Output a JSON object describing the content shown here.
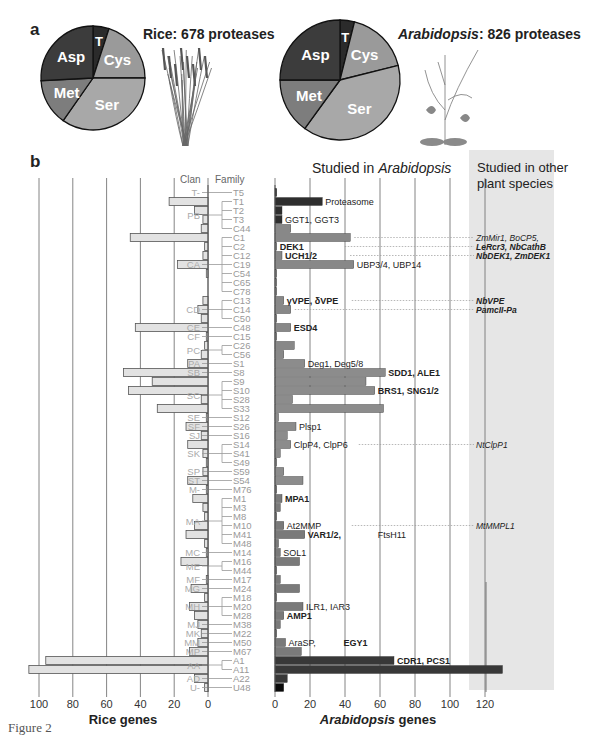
{
  "figure": {
    "caption": "Figure 2",
    "panel_a_label": "a",
    "panel_b_label": "b"
  },
  "chart_data": [
    {
      "type": "pie",
      "title": "Rice: 678 proteases",
      "species": "Rice",
      "total": 678,
      "categories": [
        "T",
        "Cys",
        "Ser",
        "Met",
        "Asp"
      ],
      "values_deg": [
        18,
        72,
        125,
        52,
        93
      ],
      "colors": [
        "#2b2b2b",
        "#9a9a9a",
        "#a8a8a8",
        "#7d7d7d",
        "#3c3c3c"
      ]
    },
    {
      "type": "pie",
      "title": "Arabidopsis: 826 proteases",
      "species": "Arabidopsis",
      "total": 826,
      "categories": [
        "T",
        "Cys",
        "Ser",
        "Met",
        "Asp"
      ],
      "values_deg": [
        14,
        62,
        140,
        54,
        90
      ],
      "colors": [
        "#2b2b2b",
        "#9a9a9a",
        "#a8a8a8",
        "#7d7d7d",
        "#3c3c3c"
      ]
    },
    {
      "type": "bar",
      "orientation": "horizontal-back-to-back",
      "left_axis": {
        "label": "Rice genes",
        "ticks": [
          100,
          80,
          60,
          40,
          20,
          0
        ],
        "range": [
          0,
          100
        ]
      },
      "right_axis": {
        "label": "Arabidopsis genes",
        "ticks": [
          0,
          20,
          40,
          60,
          80,
          100,
          120
        ],
        "range": [
          0,
          130
        ]
      },
      "column_headers": {
        "clan": "Clan",
        "family": "Family"
      },
      "right_header": "Studied in Arabidopsis",
      "other_species_header": "Studied in other plant species",
      "rows": [
        {
          "clan": "T-",
          "family": "T5",
          "rice": 0,
          "arab": 1,
          "group": "T"
        },
        {
          "clan": "PB",
          "family": "T1",
          "rice": 23,
          "arab": 27,
          "group": "T",
          "label": "Proteasome",
          "bold": false
        },
        {
          "clan": "",
          "family": "T2",
          "rice": 8,
          "arab": 4,
          "group": "T"
        },
        {
          "clan": "",
          "family": "T3",
          "rice": 3,
          "arab": 4,
          "group": "T",
          "label": "GGT1, GGT3",
          "bold": false
        },
        {
          "clan": "",
          "family": "C44",
          "rice": 4,
          "arab": 9,
          "group": "C"
        },
        {
          "clan": "CA",
          "family": "C1",
          "rice": 46,
          "arab": 43,
          "group": "C",
          "other": "ZmMir1, BoCP5,"
        },
        {
          "clan": "",
          "family": "C2",
          "rice": 2,
          "arab": 1,
          "group": "C",
          "label": "DEK1",
          "bold": true,
          "other": "LeRcr3, NbCathB"
        },
        {
          "clan": "",
          "family": "C12",
          "rice": 3,
          "arab": 4,
          "group": "C",
          "label": "UCH1/2",
          "bold": true,
          "other": "NbDEK1, ZmDEK1"
        },
        {
          "clan": "",
          "family": "C19",
          "rice": 18,
          "arab": 45,
          "group": "C",
          "label": "UBP3/4, UBP14",
          "bold": false
        },
        {
          "clan": "",
          "family": "C54",
          "rice": 1,
          "arab": 1,
          "group": "C"
        },
        {
          "clan": "",
          "family": "C65",
          "rice": 0,
          "arab": 1,
          "group": "C"
        },
        {
          "clan": "",
          "family": "C78",
          "rice": 0,
          "arab": 1,
          "group": "C"
        },
        {
          "clan": "CD",
          "family": "C13",
          "rice": 3,
          "arab": 5,
          "group": "C",
          "label": "γVPE,   δVPE",
          "bold": true,
          "other": "NbVPE"
        },
        {
          "clan": "",
          "family": "C14",
          "rice": 6,
          "arab": 9,
          "group": "C",
          "other": "PamcII-Pa"
        },
        {
          "clan": "",
          "family": "C50",
          "rice": 4,
          "arab": 1,
          "group": "C"
        },
        {
          "clan": "CE",
          "family": "C48",
          "rice": 43,
          "arab": 9,
          "group": "C",
          "label": "ESD4",
          "bold": true
        },
        {
          "clan": "CF",
          "family": "C15",
          "rice": 1,
          "arab": 1,
          "group": "C"
        },
        {
          "clan": "PC",
          "family": "C26",
          "rice": 2,
          "arab": 11,
          "group": "C"
        },
        {
          "clan": "",
          "family": "C56",
          "rice": 4,
          "arab": 5,
          "group": "C"
        },
        {
          "clan": "PA",
          "family": "S1",
          "rice": 12,
          "arab": 17,
          "group": "S",
          "label": "Deg1,    Deg5/8",
          "bold": false
        },
        {
          "clan": "SB",
          "family": "S8",
          "rice": 50,
          "arab": 63,
          "group": "S",
          "label": "SDD1, ALE1",
          "bold": true
        },
        {
          "clan": "SC",
          "family": "S9",
          "rice": 33,
          "arab": 52,
          "group": "S"
        },
        {
          "clan": "",
          "family": "S10",
          "rice": 47,
          "arab": 57,
          "group": "S",
          "label": "BRS1, SNG1/2",
          "bold": true
        },
        {
          "clan": "",
          "family": "S28",
          "rice": 4,
          "arab": 10,
          "group": "S"
        },
        {
          "clan": "",
          "family": "S33",
          "rice": 30,
          "arab": 62,
          "group": "S"
        },
        {
          "clan": "SE",
          "family": "S12",
          "rice": 1,
          "arab": 2,
          "group": "S"
        },
        {
          "clan": "SF",
          "family": "S26",
          "rice": 13,
          "arab": 12,
          "group": "S",
          "label": "Plsp1",
          "bold": false
        },
        {
          "clan": "SJ",
          "family": "S16",
          "rice": 4,
          "arab": 7,
          "group": "S"
        },
        {
          "clan": "SK",
          "family": "S14",
          "rice": 12,
          "arab": 9,
          "group": "S",
          "label": "ClpP4, ClpP6",
          "bold": false,
          "other": "NtClpP1"
        },
        {
          "clan": "",
          "family": "S41",
          "rice": 3,
          "arab": 3,
          "group": "S"
        },
        {
          "clan": "",
          "family": "S49",
          "rice": 1,
          "arab": 1,
          "group": "S"
        },
        {
          "clan": "SP",
          "family": "S59",
          "rice": 3,
          "arab": 5,
          "group": "S"
        },
        {
          "clan": "ST",
          "family": "S54",
          "rice": 12,
          "arab": 16,
          "group": "S"
        },
        {
          "clan": "M-",
          "family": "M76",
          "rice": 1,
          "arab": 1,
          "group": "M"
        },
        {
          "clan": "MA",
          "family": "M1",
          "rice": 9,
          "arab": 4,
          "group": "M",
          "label": "MPA1",
          "bold": true
        },
        {
          "clan": "",
          "family": "M3",
          "rice": 3,
          "arab": 3,
          "group": "M"
        },
        {
          "clan": "",
          "family": "M8",
          "rice": 2,
          "arab": 1,
          "group": "M"
        },
        {
          "clan": "",
          "family": "M10",
          "rice": 8,
          "arab": 5,
          "group": "M",
          "label": "At2MMP",
          "bold": false,
          "other": "MtMMPL1"
        },
        {
          "clan": "",
          "family": "M41",
          "rice": 13,
          "arab": 17,
          "group": "M",
          "label": "VAR1/2,",
          "bold": true,
          "label2": "FtsH11"
        },
        {
          "clan": "",
          "family": "M48",
          "rice": 2,
          "arab": 2,
          "group": "M"
        },
        {
          "clan": "MC",
          "family": "M14",
          "rice": 1,
          "arab": 3,
          "group": "M",
          "label": "SOL1",
          "bold": false
        },
        {
          "clan": "ME",
          "family": "M16",
          "rice": 16,
          "arab": 14,
          "group": "M"
        },
        {
          "clan": "",
          "family": "M44",
          "rice": 0,
          "arab": 1,
          "group": "M"
        },
        {
          "clan": "MF",
          "family": "M17",
          "rice": 1,
          "arab": 3,
          "group": "M"
        },
        {
          "clan": "MG",
          "family": "M24",
          "rice": 10,
          "arab": 14,
          "group": "M"
        },
        {
          "clan": "MH",
          "family": "M18",
          "rice": 2,
          "arab": 1,
          "group": "M"
        },
        {
          "clan": "",
          "family": "M20",
          "rice": 11,
          "arab": 16,
          "group": "M",
          "label": "ILR1, IAR3",
          "bold": false
        },
        {
          "clan": "",
          "family": "M28",
          "rice": 8,
          "arab": 5,
          "group": "M",
          "label": "AMP1",
          "bold": true
        },
        {
          "clan": "MJ",
          "family": "M38",
          "rice": 6,
          "arab": 3,
          "group": "M"
        },
        {
          "clan": "MK",
          "family": "M22",
          "rice": 4,
          "arab": 1,
          "group": "M"
        },
        {
          "clan": "MM",
          "family": "M50",
          "rice": 6,
          "arab": 6,
          "group": "M",
          "label": "AraSP,",
          "bold": false,
          "label2": "EGY1",
          "label2_bold": true
        },
        {
          "clan": "MP",
          "family": "M67",
          "rice": 11,
          "arab": 15,
          "group": "M"
        },
        {
          "clan": "AA",
          "family": "A1",
          "rice": 96,
          "arab": 68,
          "group": "A",
          "label": "CDR1, PCS1",
          "bold": true
        },
        {
          "clan": "",
          "family": "A11",
          "rice": 106,
          "arab": 130,
          "group": "A"
        },
        {
          "clan": "AD",
          "family": "A22",
          "rice": 8,
          "arab": 7,
          "group": "A"
        },
        {
          "clan": "U-",
          "family": "U48",
          "rice": 2,
          "arab": 5,
          "group": "U"
        }
      ],
      "group_colors": {
        "T": "#2e2e2e",
        "C": "#888888",
        "S": "#8c8c8c",
        "M": "#7a7a7a",
        "A": "#383838",
        "U": "#0a0a0a"
      },
      "rice_color": "#e2e2e2"
    }
  ]
}
